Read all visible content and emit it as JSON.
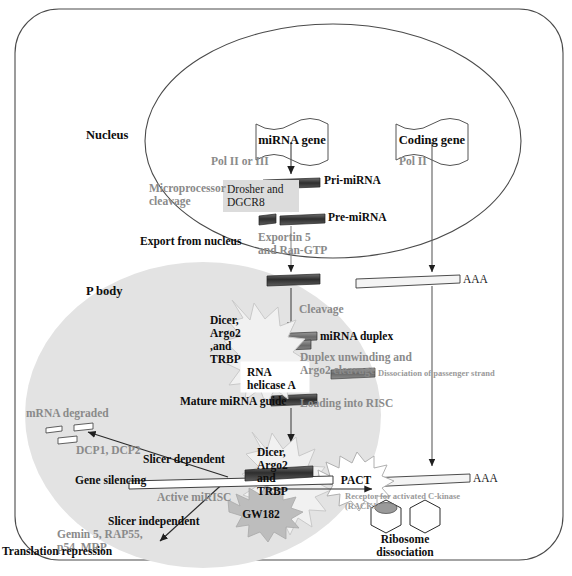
{
  "figure": {
    "compartments": {
      "cell_label": "",
      "nucleus_label": "Nucleus",
      "pbody_label": "P body"
    }
  },
  "genes": {
    "mirna_gene": "miRNA gene",
    "coding_gene": "Coding gene"
  },
  "polymerases": {
    "mirna_pol": "Pol II or III",
    "coding_pol": "Pol II"
  },
  "transcripts": {
    "pri": "Pri-miRNA",
    "pre": "Pre-miRNA",
    "duplex": "miRNA duplex",
    "mature": "Mature miRNA guide",
    "mrna_tail_nuc": "AAA",
    "mrna_tail_cyto": "AAA"
  },
  "steps": {
    "microprocessor": "Microprocessor\ncleavage",
    "drosha_box": "Drosher and\nDGCR8",
    "export": "Export from nucleus",
    "exportin": "Exportin 5\nand Ran-GTP",
    "cleavage": "Cleavage",
    "unwinding": "Duplex unwinding and\nArgo2 cleavage",
    "dissociation": "Dissociation of passenger strand",
    "loading": "Loading into RISC",
    "slicer_dependent": "Slicer dependent",
    "slicer_independent": "Slicer independent",
    "gene_silencing": "Gene silencing",
    "active_mirisc": "Active miRISC",
    "mrna_degraded": "mRNA degraded",
    "decapping": "DCP1, DCP2",
    "repressors": "Gemin 5, RAP55,\np54, MRP",
    "translation_repression": "Translation repression",
    "ribosome": "Ribosome\ndissociation",
    "rack1": "Receptor for activated C-kinase\n(RACK1)"
  },
  "complexes": {
    "dicer_burst_top": "Dicer,\nArgo2\n,and\nTRBP",
    "rna_helicase": "RNA\nhelicase A",
    "dicer_burst_bottom": "Dicer,\nArgo2\nand\nTRBP",
    "gw182": "GW182",
    "pact": "PACT"
  },
  "colors": {
    "outline": "#4a4a4a",
    "rna_dark": "#3a3a3a",
    "rna_mid": "#6e6e6e",
    "pbody_fill": "#e2e2e2",
    "box_fill": "#dcdcdc",
    "gw182_fill": "#b9b9b9",
    "grey_text": "#8a8a8a",
    "black_text": "#0d0d0d"
  }
}
